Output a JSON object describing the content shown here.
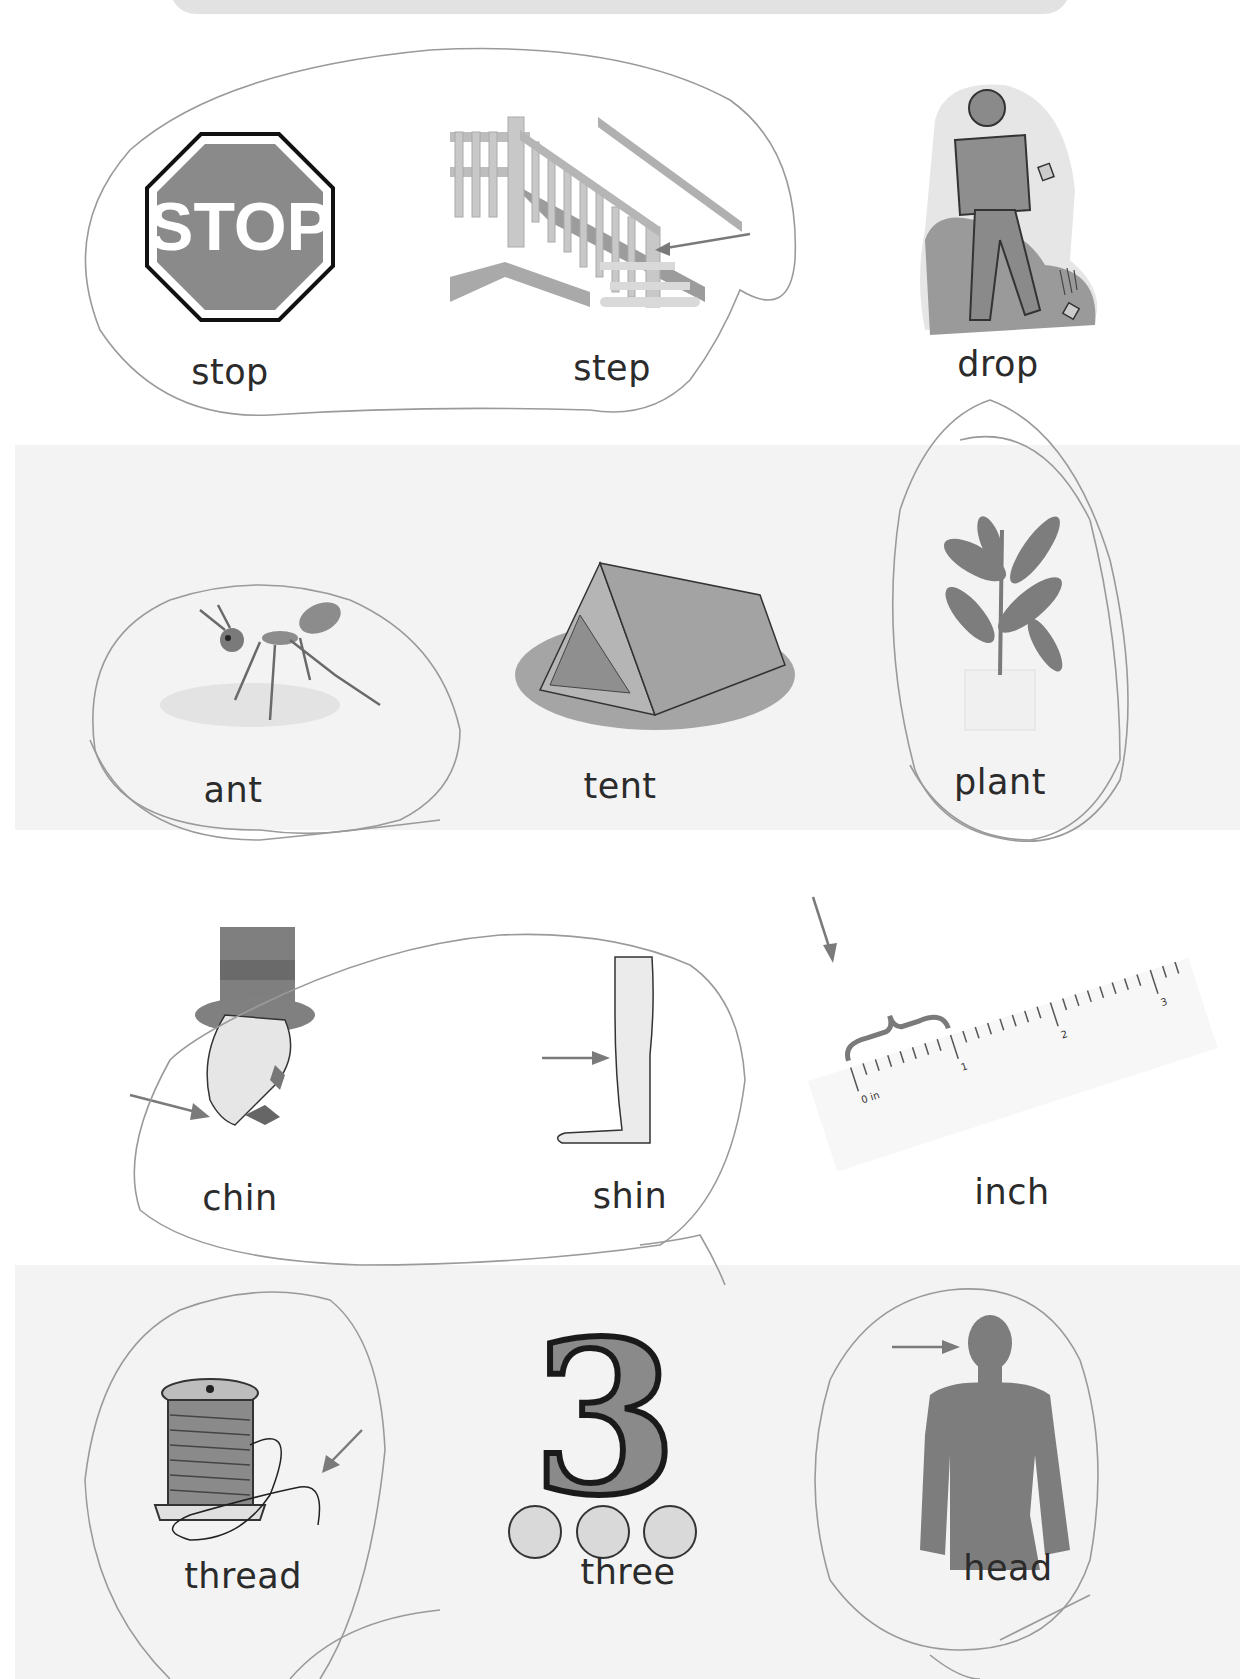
{
  "worksheet": {
    "header_bar": {
      "color": "#e2e2e2"
    },
    "rows": [
      {
        "band_shaded": false,
        "items": [
          {
            "word": "stop",
            "picture": "stop-sign",
            "sign_text": "STOP",
            "circled": true
          },
          {
            "word": "step",
            "picture": "staircase-with-arrow",
            "circled": true
          },
          {
            "word": "drop",
            "picture": "person-dropping-groceries",
            "circled": false
          }
        ]
      },
      {
        "band_shaded": true,
        "items": [
          {
            "word": "ant",
            "picture": "ant",
            "circled": true
          },
          {
            "word": "tent",
            "picture": "tent",
            "circled": false
          },
          {
            "word": "plant",
            "picture": "potted-plant",
            "circled": true
          }
        ]
      },
      {
        "band_shaded": false,
        "items": [
          {
            "word": "chin",
            "picture": "man-in-top-hat-arrow-to-chin",
            "circled": true
          },
          {
            "word": "shin",
            "picture": "leg-arrow-to-shin",
            "circled": true
          },
          {
            "word": "inch",
            "picture": "ruler",
            "circled": false,
            "ruler_labels": [
              "0 in",
              "1",
              "2",
              "3"
            ]
          }
        ]
      },
      {
        "band_shaded": true,
        "items": [
          {
            "word": "thread",
            "picture": "spool-of-thread-arrow",
            "circled": true
          },
          {
            "word": "three",
            "picture": "number-three-with-dots",
            "numeral": "3",
            "dot_count": 3,
            "circled": false
          },
          {
            "word": "head",
            "picture": "body-silhouette-arrow-to-head",
            "circled": true
          }
        ]
      }
    ],
    "colors": {
      "band": "#f3f3f3",
      "ink": "#2b2b2b",
      "pencil": "#9a9a9a",
      "art_gray": "#8a8a8a",
      "art_dark": "#6f6f6f"
    }
  }
}
